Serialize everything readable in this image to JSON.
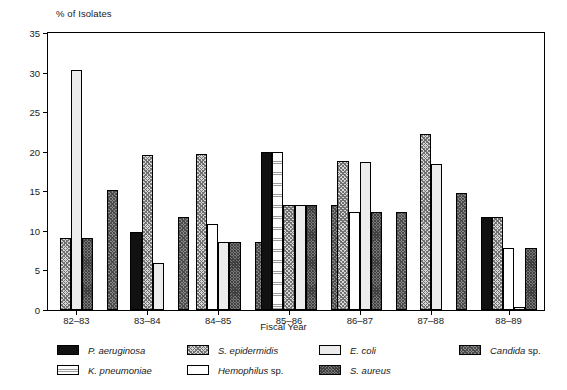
{
  "chart_data": {
    "type": "bar",
    "title": "",
    "xlabel": "Fiscal Year",
    "ylabel": "% of Isolates",
    "categories": [
      "82–83",
      "83–84",
      "84–85",
      "85–86",
      "86–87",
      "87–88",
      "88–89"
    ],
    "ylim": [
      0,
      35
    ],
    "yticks": [
      0,
      5,
      10,
      15,
      20,
      25,
      30,
      35
    ],
    "grid": false,
    "legend_position": "below",
    "series": [
      {
        "name": "P. aeruginosa",
        "key": "p_aeruginosa",
        "pattern": "solid-black",
        "values": [
          0,
          9.8,
          0,
          20.0,
          0,
          0,
          11.7
        ]
      },
      {
        "name": "K. pneumoniae",
        "key": "k_pneumoniae",
        "pattern": "fine-grid",
        "values": [
          0,
          0,
          0,
          20.0,
          0,
          0,
          0
        ]
      },
      {
        "name": "S. epidermidis",
        "key": "s_epidermidis",
        "pattern": "stipple-gray",
        "values": [
          9.1,
          19.6,
          19.7,
          13.3,
          18.8,
          22.2,
          11.8
        ]
      },
      {
        "name": "Hemophilus sp.",
        "key": "hemophilus",
        "pattern": "white",
        "values": [
          0,
          0,
          10.9,
          0,
          12.4,
          0,
          7.8
        ]
      },
      {
        "name": "E. coli",
        "key": "e_coli",
        "pattern": "light-gray",
        "values": [
          30.3,
          6.0,
          8.6,
          13.3,
          18.7,
          18.5,
          0.4
        ]
      },
      {
        "name": "S. aureus",
        "key": "s_aureus",
        "pattern": "dark-gray",
        "values": [
          9.1,
          0,
          8.6,
          13.3,
          12.4,
          0,
          7.8
        ]
      },
      {
        "name": "Candida sp.",
        "key": "candida",
        "pattern": "mid-dark-gray",
        "values": [
          15.2,
          11.8,
          8.6,
          13.3,
          12.4,
          14.8,
          0
        ]
      }
    ]
  },
  "legend": {
    "entries": [
      {
        "label_italic": "P. aeruginosa",
        "label_roman": "",
        "pattern": "solid-black"
      },
      {
        "label_italic": "K. pneumoniae",
        "label_roman": "",
        "pattern": "fine-grid"
      },
      {
        "label_italic": "S. epidermidis",
        "label_roman": "",
        "pattern": "stipple-gray"
      },
      {
        "label_italic": "Hemophilus",
        "label_roman": " sp.",
        "pattern": "white"
      },
      {
        "label_italic": "E. coli",
        "label_roman": "",
        "pattern": "light-gray"
      },
      {
        "label_italic": "S. aureus",
        "label_roman": "",
        "pattern": "dark-gray"
      },
      {
        "label_italic": "Candida",
        "label_roman": " sp.",
        "pattern": "mid-dark-gray"
      }
    ]
  },
  "colors": {
    "axis": "#000000",
    "solid_black": "#111111",
    "light_gray": "#ececec",
    "dark_gray": "#7a7a7a",
    "stipple_gray": "#d7d7d7"
  }
}
